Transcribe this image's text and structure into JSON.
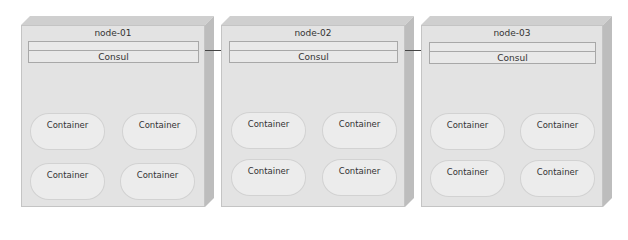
{
  "diagram": {
    "nodes": [
      {
        "label": "node-01",
        "service": "Consul",
        "containers": [
          "Container",
          "Container",
          "Container",
          "Container"
        ]
      },
      {
        "label": "node-02",
        "service": "Consul",
        "containers": [
          "Container",
          "Container",
          "Container",
          "Container"
        ]
      },
      {
        "label": "node-03",
        "service": "Consul",
        "containers": [
          "Container",
          "Container",
          "Container",
          "Container"
        ]
      }
    ],
    "edges": [
      {
        "from": "node-01.Consul",
        "to": "node-02.Consul"
      },
      {
        "from": "node-02.Consul",
        "to": "node-03.Consul"
      }
    ],
    "colors": {
      "face": "#e3e3e3",
      "top": "#cfcfcf",
      "side": "#bdbdbd",
      "line": "#444444"
    }
  }
}
